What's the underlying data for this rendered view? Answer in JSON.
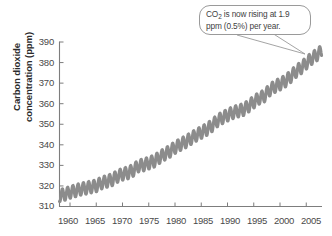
{
  "chart_data": {
    "type": "line",
    "title": "",
    "subtitle": "",
    "xlabel": "",
    "ylabel": "Carbon dioxide concentration (ppm)",
    "ylabel_line1": "Carbon dioxide",
    "ylabel_line2": "concentration (ppm)",
    "grid": false,
    "legend": "none",
    "xlim": [
      1958,
      2008
    ],
    "ylim": [
      310,
      390
    ],
    "xticks": [
      1960,
      1965,
      1970,
      1975,
      1980,
      1985,
      1990,
      1995,
      2000,
      2005
    ],
    "yticks": [
      310,
      320,
      330,
      340,
      350,
      360,
      370,
      380,
      390
    ],
    "series_color": "#8c8c8c",
    "axis_color": "#7d7d7d",
    "series": [
      {
        "name": "Atmospheric CO2 (Mauna Loa monthly mean)",
        "description": "Keeling curve: rising annual trend with seasonal oscillation of about 6 ppm peak-to-trough",
        "seasonal_amplitude_ppm": 3.0,
        "x": [
          1958,
          1959,
          1960,
          1961,
          1962,
          1963,
          1964,
          1965,
          1966,
          1967,
          1968,
          1969,
          1970,
          1971,
          1972,
          1973,
          1974,
          1975,
          1976,
          1977,
          1978,
          1979,
          1980,
          1981,
          1982,
          1983,
          1984,
          1985,
          1986,
          1987,
          1988,
          1989,
          1990,
          1991,
          1992,
          1993,
          1994,
          1995,
          1996,
          1997,
          1998,
          1999,
          2000,
          2001,
          2002,
          2003,
          2004,
          2005,
          2006,
          2007,
          2008
        ],
        "values": [
          315.3,
          315.9,
          316.9,
          317.6,
          318.4,
          318.9,
          319.5,
          320.0,
          321.4,
          322.2,
          323.0,
          324.6,
          325.7,
          326.3,
          327.5,
          329.7,
          330.2,
          331.1,
          332.0,
          333.8,
          335.4,
          336.8,
          338.7,
          340.1,
          341.4,
          343.0,
          344.6,
          346.0,
          347.4,
          349.2,
          351.6,
          353.1,
          354.4,
          355.6,
          356.4,
          357.1,
          358.8,
          360.8,
          362.6,
          363.7,
          366.6,
          368.3,
          369.5,
          371.0,
          373.1,
          375.6,
          377.4,
          379.7,
          381.9,
          383.7,
          385.6
        ]
      }
    ],
    "annotations": [
      {
        "name": "co2-rate-callout",
        "text_line1_prefix": "CO",
        "text_line1_sub": "2",
        "text_line1_rest": " is now rising at 1.9",
        "text_line2": "ppm (0.5%) per year.",
        "full_text": "CO2 is now rising at 1.9 ppm (0.5%) per year.",
        "points_to_year": 2007,
        "points_to_value": 384
      }
    ]
  },
  "axis": {
    "y_labels": [
      "390",
      "380",
      "370",
      "360",
      "350",
      "340",
      "330",
      "320",
      "310"
    ],
    "x_labels": [
      "1960",
      "1965",
      "1970",
      "1975",
      "1980",
      "1985",
      "1990",
      "1995",
      "2000",
      "2005"
    ]
  },
  "callout": {
    "prefix": "CO",
    "sub": "2",
    "rest": " is now rising at 1.9 ppm (0.5%) per year."
  }
}
